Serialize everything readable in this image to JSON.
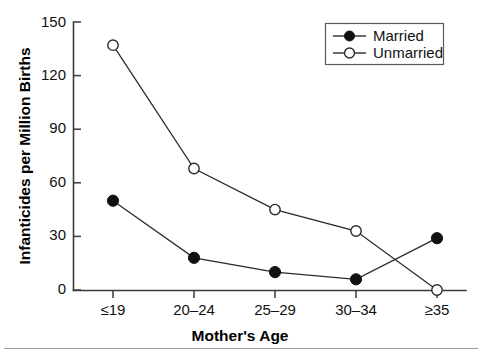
{
  "chart_data": {
    "type": "line",
    "title": "",
    "xlabel": "Mother's Age",
    "ylabel": "Infanticides per Million Births",
    "categories": [
      "≤19",
      "20–24",
      "25–29",
      "30–34",
      "≥35"
    ],
    "series": [
      {
        "name": "Married",
        "marker": "filled-circle",
        "values": [
          50,
          18,
          10,
          6,
          29
        ]
      },
      {
        "name": "Unmarried",
        "marker": "open-circle",
        "values": [
          137,
          68,
          45,
          33,
          0
        ]
      }
    ],
    "ylim": [
      0,
      150
    ],
    "yticks": [
      0,
      30,
      60,
      90,
      120,
      150
    ],
    "ytick_labels": [
      "0",
      "30",
      "60",
      "90",
      "120",
      "150"
    ],
    "grid": false,
    "legend_position": "top-right",
    "colors": {
      "axis": "#3b3b3b",
      "line": "#2b2b2b",
      "married_marker": "#111111",
      "unmarried_marker": "#ffffff",
      "text": "#111111"
    }
  },
  "legend": {
    "entries": [
      {
        "label": "Married"
      },
      {
        "label": "Unmarried"
      }
    ]
  }
}
